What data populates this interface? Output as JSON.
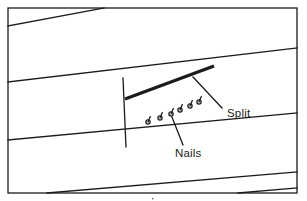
{
  "figure": {
    "domain": "technical line diagram",
    "width": 307,
    "height": 201,
    "background_color": "#ffffff",
    "line_color": "#1b1b1b",
    "text_color": "#1b1b1b"
  },
  "border": {
    "name": "figure-border",
    "x": 8,
    "y": 8,
    "width": 289,
    "height": 185,
    "stroke_width": 1.3
  },
  "planks": {
    "description": "Parallel diagonal board edges running from lower-left to upper-right",
    "stroke_width": 1.3,
    "lines": [
      {
        "id": "plank-edge-1",
        "x1": 8,
        "y1": 26,
        "x2": 104,
        "y2": 8
      },
      {
        "id": "plank-edge-2",
        "x1": 8,
        "y1": 82,
        "x2": 297,
        "y2": 48
      },
      {
        "id": "plank-edge-3",
        "x1": 8,
        "y1": 140,
        "x2": 297,
        "y2": 113
      },
      {
        "id": "plank-edge-4",
        "x1": 47,
        "y1": 193,
        "x2": 297,
        "y2": 172
      },
      {
        "id": "plank-edge-5",
        "x1": 238,
        "y1": 193,
        "x2": 297,
        "y2": 188
      }
    ]
  },
  "butt_joint": {
    "name": "butt-joint-line",
    "description": "Vertical end joint between two boards",
    "x1": 123,
    "y1": 78,
    "x2": 126,
    "y2": 147,
    "stroke_width": 1.3
  },
  "split": {
    "name": "split-line",
    "description": "Heavy black line representing the split in the board",
    "x1": 125,
    "y1": 99,
    "x2": 214,
    "y2": 66,
    "stroke_width": 3.4
  },
  "nails": {
    "description": "Row of nail symbols along the board edge near the split",
    "count": 6,
    "head_radius": 2.1,
    "stem_length": 5.5,
    "stroke_width": 1.3,
    "items": [
      {
        "id": "nail-1",
        "x": 148,
        "y": 122
      },
      {
        "id": "nail-2",
        "x": 160,
        "y": 118
      },
      {
        "id": "nail-3",
        "x": 171,
        "y": 114
      },
      {
        "id": "nail-4",
        "x": 180,
        "y": 110
      },
      {
        "id": "nail-5",
        "x": 190,
        "y": 106
      },
      {
        "id": "nail-6",
        "x": 199,
        "y": 102
      }
    ]
  },
  "labels": [
    {
      "id": "split-label",
      "text": "Split",
      "text_x": 227,
      "text_y": 117,
      "leader": {
        "x1": 222,
        "y1": 108,
        "x2": 193,
        "y2": 77
      }
    },
    {
      "id": "nails-label",
      "text": "Nails",
      "text_x": 175,
      "text_y": 157,
      "leader": {
        "x1": 183,
        "y1": 145,
        "x2": 172,
        "y2": 117
      }
    }
  ],
  "artifacts": {
    "bottom_speck": {
      "id": "bottom-speck",
      "x": 152,
      "y": 198,
      "size": 1.4
    }
  }
}
